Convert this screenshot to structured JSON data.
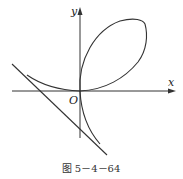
{
  "figure": {
    "caption": "图 5－4－64",
    "labels": {
      "x_axis": "x",
      "y_axis": "y",
      "origin": "O"
    },
    "curve": "folium-of-descartes",
    "elements": [
      "loop",
      "left-branch",
      "lower-branch",
      "oblique-asymptote",
      "x-axis",
      "y-axis"
    ],
    "colors": {
      "stroke": "#333333",
      "background": "#ffffff"
    }
  }
}
